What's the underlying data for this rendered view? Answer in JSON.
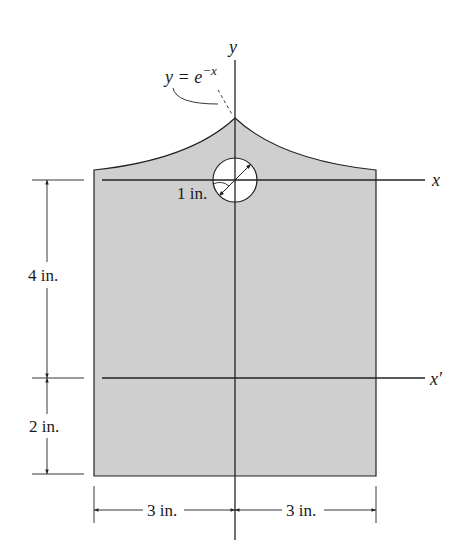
{
  "figure": {
    "type": "composite-area-with-hole",
    "colors": {
      "fill": "#cfcfcf",
      "stroke": "#222222",
      "background": "#ffffff"
    }
  },
  "labels": {
    "y_axis": "y",
    "x_axis": "x",
    "x_prime_axis": "x′",
    "curve_equation_lhs": "y = e",
    "curve_equation_exp": "−x",
    "hole_radius": "1 in.",
    "dim_upper": "4 in.",
    "dim_lower": "2 in.",
    "dim_left": "3 in.",
    "dim_right": "3 in."
  }
}
